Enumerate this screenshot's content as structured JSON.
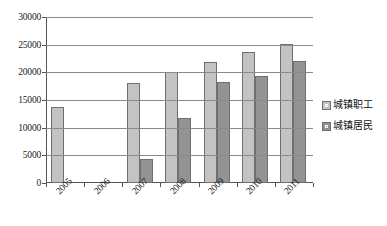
{
  "chart_data": {
    "type": "bar",
    "title": "",
    "subtitle": "",
    "xlabel": "",
    "ylabel": "",
    "categories": [
      "2005",
      "2006",
      "2007",
      "2008",
      "2009",
      "2010",
      "2011"
    ],
    "series": [
      {
        "name": "城镇职工",
        "color": "#c3c3c3",
        "values": [
          13800,
          null,
          18000,
          20000,
          21800,
          23700,
          25200
        ]
      },
      {
        "name": "城镇居民",
        "color": "#939393",
        "values": [
          null,
          null,
          4300,
          11700,
          18200,
          19300,
          22000
        ]
      }
    ],
    "ylim": [
      0,
      30000
    ],
    "ytick_values": [
      0,
      5000,
      10000,
      15000,
      20000,
      25000,
      30000
    ],
    "ytick_labels": [
      "0",
      "5000",
      "10000",
      "15000",
      "20000",
      "25000",
      "30000"
    ],
    "grid": true,
    "grid_axis": "y",
    "legend_position": "right",
    "xtick_rotation": -45
  },
  "legend": {
    "items": [
      {
        "label": "城镇职工"
      },
      {
        "label": "城镇居民"
      }
    ]
  }
}
